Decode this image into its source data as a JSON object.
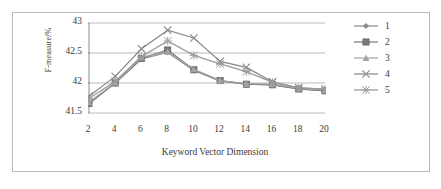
{
  "chart_data": {
    "type": "line",
    "title": "",
    "xlabel": "Keyword Vector Dimension",
    "ylabel": "F-measure/%",
    "categories": [
      2,
      4,
      6,
      8,
      10,
      12,
      14,
      16,
      18,
      20
    ],
    "x": [
      2,
      4,
      6,
      8,
      10,
      12,
      14,
      16,
      18,
      20
    ],
    "xlim": [
      2,
      20
    ],
    "ylim": [
      41.5,
      43.0
    ],
    "yticks": [
      "41.5",
      "42",
      "42.5",
      "43"
    ],
    "ytick_values": [
      41.5,
      42.0,
      42.5,
      43.0
    ],
    "xticks": [
      "2",
      "4",
      "6",
      "8",
      "10",
      "12",
      "14",
      "16",
      "18",
      "20"
    ],
    "grid": "horizontal",
    "legend_position": "right",
    "series": [
      {
        "name": "1",
        "marker": "diamond",
        "color": "#8d8d8d",
        "values": [
          41.66,
          42.0,
          42.4,
          42.51,
          42.21,
          42.03,
          41.98,
          41.97,
          41.9,
          41.87
        ]
      },
      {
        "name": "2",
        "marker": "square",
        "color": "#7a7a7a",
        "values": [
          41.66,
          42.0,
          42.41,
          42.55,
          42.22,
          42.04,
          41.98,
          41.97,
          41.9,
          41.87
        ]
      },
      {
        "name": "3",
        "marker": "triangle",
        "color": "#a5a5a5",
        "values": [
          41.68,
          42.01,
          42.43,
          42.52,
          42.23,
          42.04,
          41.99,
          41.98,
          41.91,
          41.88
        ]
      },
      {
        "name": "4",
        "marker": "x",
        "color": "#8a8a8a",
        "values": [
          41.78,
          42.11,
          42.57,
          42.88,
          42.75,
          42.36,
          42.26,
          42.02,
          41.92,
          41.9
        ]
      },
      {
        "name": "5",
        "marker": "star",
        "color": "#9b9b9b",
        "values": [
          41.74,
          42.03,
          42.44,
          42.7,
          42.46,
          42.32,
          42.19,
          42.01,
          41.92,
          41.9
        ]
      }
    ]
  },
  "legend": {
    "entries": [
      {
        "label": "1"
      },
      {
        "label": "2"
      },
      {
        "label": "3"
      },
      {
        "label": "4"
      },
      {
        "label": "5"
      }
    ]
  }
}
